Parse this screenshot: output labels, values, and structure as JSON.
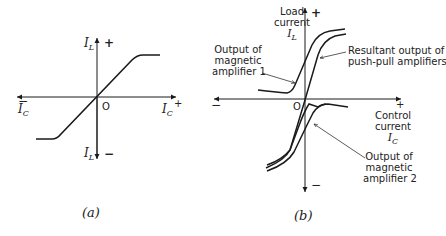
{
  "panel_a": {
    "caption": "(a)",
    "y_axis_label_top": "I",
    "y_axis_label_top_sub": "L",
    "y_axis_sign_top": "+",
    "y_axis_label_bottom": "I",
    "y_axis_label_bottom_sub": "L",
    "y_axis_sign_bottom": "−",
    "x_axis_label_left": "I",
    "x_axis_label_left_sub": "C",
    "x_axis_sign_left": "−",
    "x_axis_label_right": "I",
    "x_axis_label_right_sub": "C",
    "x_axis_sign_right": "+",
    "origin": "O"
  },
  "panel_b": {
    "caption": "(b)",
    "y_axis_title_line1": "Load",
    "y_axis_title_line2": "current",
    "y_axis_symbol": "I",
    "y_axis_symbol_sub": "L",
    "y_axis_sign_top": "+",
    "y_axis_sign_bottom": "−",
    "x_axis_sign_left": "−",
    "x_axis_sign_right": "+",
    "x_axis_title_line1": "Control",
    "x_axis_title_line2": "current",
    "x_axis_symbol": "I",
    "x_axis_symbol_sub": "C",
    "origin": "O",
    "annotations": {
      "amp1_line1": "Output of",
      "amp1_line2": "magnetic",
      "amp1_line3": "amplifier 1",
      "resultant_line1": "Resultant output of",
      "resultant_line2": "push-pull amplifiers",
      "amp2_line1": "Output of",
      "amp2_line2": "magnetic",
      "amp2_line3": "amplifier 2"
    }
  },
  "colors": {
    "line": "#1a1a1a",
    "background": "#ffffff"
  }
}
